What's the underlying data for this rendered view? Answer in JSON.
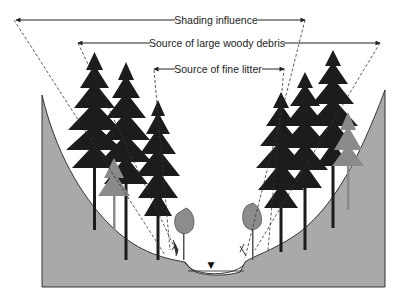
{
  "diagram": {
    "labels": {
      "shading": "Shading influence",
      "large_woody_debris": "Source of large woody debris",
      "fine_litter": "Source of fine litter"
    },
    "elements": {
      "water_surface_marker": "▼",
      "left_bank": "valley slope (left)",
      "right_bank": "valley slope (right)",
      "stream": "stream channel"
    },
    "colors": {
      "ground": "#a9a9a9",
      "tree": "#1c1c1c",
      "tree_faded": "#8a8a8a",
      "shrub": "#8c8c8c",
      "line": "#222222"
    }
  }
}
